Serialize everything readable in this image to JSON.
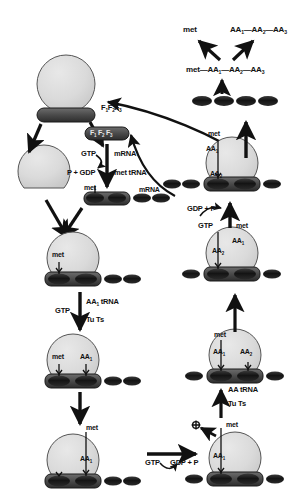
{
  "figure": {
    "colors": {
      "ink": "#111111",
      "large_subunit_fill": "#d9d9d9",
      "large_subunit_stroke": "#444444",
      "small_subunit_fill": "#4a4a4a",
      "small_subunit_stroke": "#1a1a1a",
      "trna_fill": "#1e1e1e",
      "background": "#ffffff"
    }
  },
  "labels": {
    "released_met": "met",
    "released_peptide": "AA₁—AA₂—AA₃",
    "full_peptide": "met—AA₁—AA₂—AA₃",
    "initiation_factors_free": "F₁F₂F₃",
    "initiation_factors_bound": "F₁ F₂ F₃",
    "gtp": "GTP",
    "p_plus_gdp": "P + GDP",
    "mrna_in": "mRNA",
    "met_trna": "met tRNA",
    "mrna_strand": "mRNA",
    "met_small_subunit": "met",
    "aa1_trna": "AA₁ tRNA",
    "gtp_elong": "GTP",
    "tu_ts": "Tu Ts",
    "met_site": "met",
    "aa1_site": "AA₁",
    "met_bottom_left": "met",
    "aa1_bottom_left": "AA₁",
    "translocation_gtp": "GTP",
    "translocation_gdp_p": "GDP + P",
    "aa_trna_right": "AA tRNA",
    "tu_ts_right": "Tu Ts",
    "met_bottom_right": "met",
    "aa1_bottom_right": "AA₁",
    "met_mid_right": "met",
    "aa1_mid_right": "AA₁",
    "aa2_mid_right": "AA₂",
    "gdp_plus_p_right": "GDP + P",
    "gtp_right": "GTP",
    "met_upper_right": "met",
    "aa1_upper_right": "AA₁",
    "aa2_upper_right": "AA₂"
  }
}
